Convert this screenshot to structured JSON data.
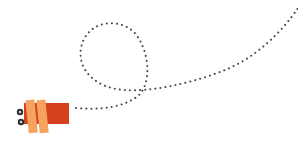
{
  "scene": {
    "description": "Illustration of a small bug-like character with a dotted looping flight path",
    "colors": {
      "background": "#ffffff",
      "body": "#d5401f",
      "bands": "#f5a35e",
      "eyes_outer": "#2b2b2b",
      "eyes_inner": "#cfd3d8",
      "path_dots": "#4a4a4a"
    },
    "character": {
      "name": "bug-character",
      "x": 22,
      "y": 103,
      "width": 47,
      "height": 21
    },
    "path": {
      "style": "dotted",
      "start": [
        76,
        108
      ],
      "end": [
        298,
        8
      ],
      "loop_center": [
        114,
        57
      ]
    }
  }
}
